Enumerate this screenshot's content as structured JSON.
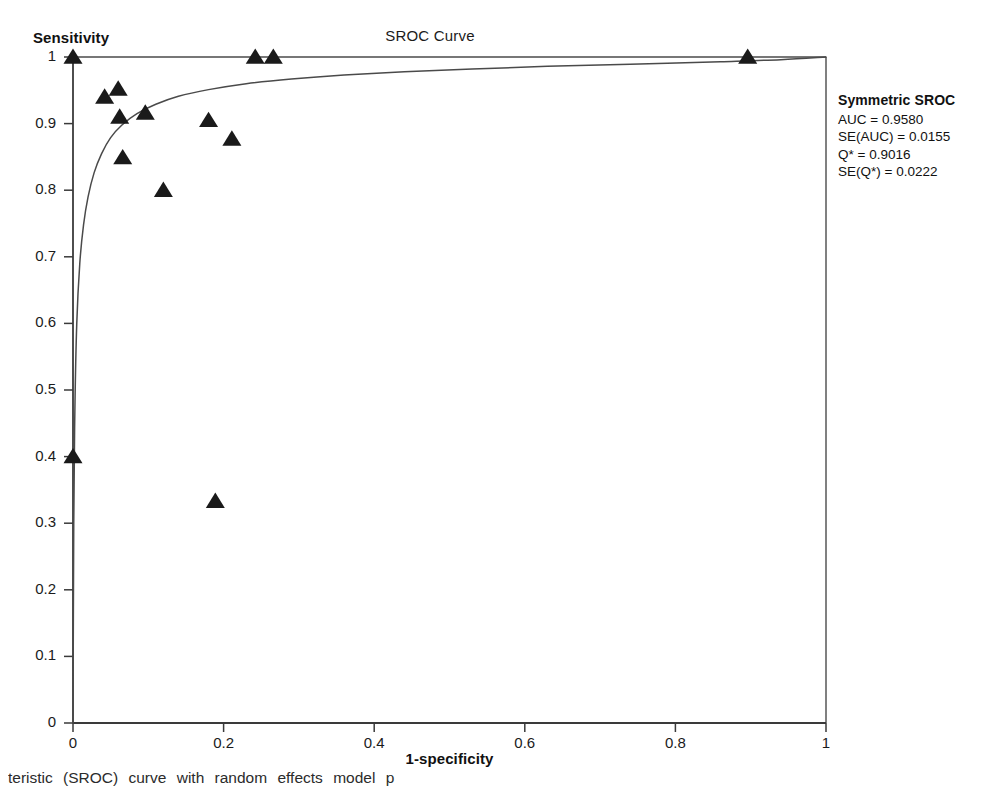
{
  "figure": {
    "title": "SROC Curve",
    "caption": "teristic (SROC) curve with random effects model p"
  },
  "axes": {
    "y_name": "Sensitivity",
    "x_name": "1-specificity",
    "y_ticks": [
      "0",
      "0.1",
      "0.2",
      "0.3",
      "0.4",
      "0.5",
      "0.6",
      "0.7",
      "0.8",
      "0.9",
      "1"
    ],
    "x_ticks": [
      "0",
      "0.2",
      "0.4",
      "0.6",
      "0.8",
      "1"
    ]
  },
  "legend": {
    "title": "Symmetric SROC",
    "lines": [
      "AUC = 0.9580",
      "SE(AUC) = 0.0155",
      "Q* = 0.9016",
      "SE(Q*) = 0.0222"
    ]
  },
  "chart_data": {
    "type": "scatter",
    "title": "SROC Curve",
    "xlabel": "1-specificity",
    "ylabel": "Sensitivity",
    "xlim": [
      0,
      1
    ],
    "ylim": [
      0,
      1
    ],
    "grid": false,
    "legend_position": "right-outside",
    "marker": "triangle",
    "marker_color": "#1a1a1a",
    "curve_color": "#3a3a3a",
    "annotations": {
      "AUC": 0.958,
      "SE_AUC": 0.0155,
      "Q_star": 0.9016,
      "SE_Q_star": 0.0222
    },
    "series": [
      {
        "name": "Study estimates",
        "points": [
          {
            "x": 0.0,
            "y": 1.0
          },
          {
            "x": 0.0,
            "y": 0.4
          },
          {
            "x": 0.042,
            "y": 0.94
          },
          {
            "x": 0.06,
            "y": 0.952
          },
          {
            "x": 0.062,
            "y": 0.91
          },
          {
            "x": 0.066,
            "y": 0.849
          },
          {
            "x": 0.096,
            "y": 0.916
          },
          {
            "x": 0.12,
            "y": 0.8
          },
          {
            "x": 0.18,
            "y": 0.905
          },
          {
            "x": 0.189,
            "y": 0.333
          },
          {
            "x": 0.211,
            "y": 0.877
          },
          {
            "x": 0.242,
            "y": 1.0
          },
          {
            "x": 0.266,
            "y": 1.0
          },
          {
            "x": 0.896,
            "y": 1.0
          }
        ]
      }
    ],
    "sroc_curve": {
      "name": "Symmetric SROC curve",
      "points": [
        {
          "x": 0.0,
          "y": 0.0
        },
        {
          "x": 0.001,
          "y": 0.3
        },
        {
          "x": 0.0025,
          "y": 0.47
        },
        {
          "x": 0.005,
          "y": 0.6
        },
        {
          "x": 0.009,
          "y": 0.69
        },
        {
          "x": 0.014,
          "y": 0.748
        },
        {
          "x": 0.02,
          "y": 0.79
        },
        {
          "x": 0.028,
          "y": 0.826
        },
        {
          "x": 0.038,
          "y": 0.855
        },
        {
          "x": 0.05,
          "y": 0.879
        },
        {
          "x": 0.065,
          "y": 0.898
        },
        {
          "x": 0.085,
          "y": 0.915
        },
        {
          "x": 0.11,
          "y": 0.929
        },
        {
          "x": 0.14,
          "y": 0.941
        },
        {
          "x": 0.18,
          "y": 0.951
        },
        {
          "x": 0.23,
          "y": 0.96
        },
        {
          "x": 0.29,
          "y": 0.967
        },
        {
          "x": 0.36,
          "y": 0.973
        },
        {
          "x": 0.44,
          "y": 0.978
        },
        {
          "x": 0.53,
          "y": 0.982
        },
        {
          "x": 0.63,
          "y": 0.986
        },
        {
          "x": 0.74,
          "y": 0.989
        },
        {
          "x": 0.86,
          "y": 0.993
        },
        {
          "x": 0.94,
          "y": 0.996
        },
        {
          "x": 1.0,
          "y": 1.0
        }
      ]
    }
  }
}
